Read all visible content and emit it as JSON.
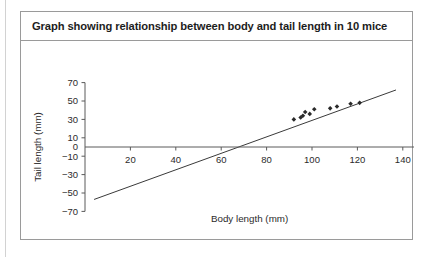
{
  "panel": {
    "title": "Graph showing relationship between body and tail length in 10 mice"
  },
  "chart_data": {
    "type": "scatter",
    "title": "Graph showing relationship between body and tail length in 10 mice",
    "xlabel": "Body length (mm)",
    "ylabel": "Tail length (mm)",
    "xlim": [
      0,
      145
    ],
    "ylim": [
      -70,
      70
    ],
    "xticks": [
      20,
      40,
      60,
      80,
      100,
      120,
      140
    ],
    "yticks": [
      70,
      50,
      30,
      10,
      0,
      -10,
      -30,
      -50,
      -70
    ],
    "xtick_labels": [
      "20",
      "40",
      "60",
      "80",
      "100",
      "120",
      "140"
    ],
    "ytick_labels": [
      "70",
      "50",
      "30",
      "10",
      "0",
      "−10",
      "−30",
      "−50",
      "−70"
    ],
    "grid": false,
    "legend": "none",
    "series": [
      {
        "name": "mice",
        "marker": "diamond",
        "points": [
          {
            "x": 92,
            "y": 30
          },
          {
            "x": 95,
            "y": 32
          },
          {
            "x": 96,
            "y": 34
          },
          {
            "x": 97,
            "y": 38
          },
          {
            "x": 99,
            "y": 36
          },
          {
            "x": 101,
            "y": 41
          },
          {
            "x": 108,
            "y": 42
          },
          {
            "x": 111,
            "y": 44
          },
          {
            "x": 117,
            "y": 47
          },
          {
            "x": 121,
            "y": 48
          }
        ]
      }
    ],
    "trendline": {
      "name": "line of best fit",
      "x0": 4,
      "y0": -57,
      "x1": 137,
      "y1": 62
    }
  }
}
